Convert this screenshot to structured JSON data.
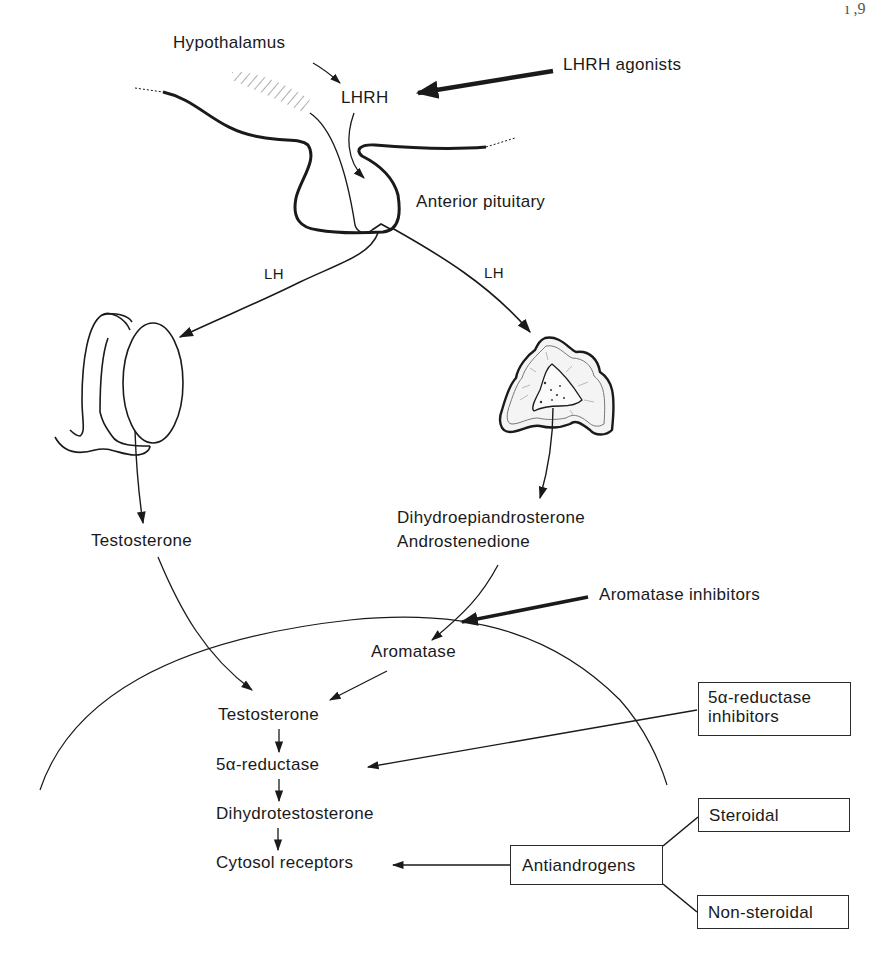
{
  "figure": {
    "page_mark": "ı ,9",
    "hypothalamus": {
      "label": "Hypothalamus",
      "hormone": "LHRH"
    },
    "drug_lhrh": "LHRH agonists",
    "pituitary": "Anterior pituitary",
    "lh_left": "LH",
    "lh_right": "LH",
    "testis_product": "Testosterone",
    "adrenal_products": {
      "line1": "Dihydroepiandrosterone",
      "line2": "Androstenedione"
    },
    "drug_aromatase": "Aromatase inhibitors",
    "cell": {
      "aromatase": "Aromatase",
      "testosterone": "Testosterone",
      "reductase": "5α-reductase",
      "dht": "Dihydrotestosterone",
      "receptors": "Cytosol receptors"
    },
    "drug_5ar": {
      "line1": "5α-reductase",
      "line2": "inhibitors"
    },
    "antiandrogens": {
      "label": "Antiandrogens",
      "types": [
        "Steroidal",
        "Non-steroidal"
      ]
    },
    "colors": {
      "ink": "#1a1a1a",
      "background": "#ffffff"
    }
  }
}
